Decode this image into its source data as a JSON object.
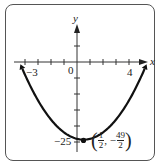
{
  "chart_data": {
    "type": "line",
    "title": "",
    "function": "y = x^2 - x - 24",
    "xlabel": "x",
    "ylabel": "y",
    "x_intercepts": [
      -3,
      4
    ],
    "y_intercept": -24,
    "vertex": {
      "x": 0.5,
      "y": -24.5,
      "label": "(1/2, -49/2)"
    },
    "tick_labels": {
      "x": [
        "-3",
        "0",
        "4"
      ],
      "y": [
        "-25"
      ]
    },
    "xlim": [
      -4.5,
      5.5
    ],
    "ylim": [
      -27,
      15
    ],
    "grid": false
  },
  "labels": {
    "x_axis": "x",
    "y_axis": "y",
    "origin": "0",
    "x_neg3": "−3",
    "x_4": "4",
    "y_neg25": "−25",
    "vertex_label_open": "(",
    "vertex_num1": "1",
    "vertex_den1": "2",
    "vertex_comma": ", −",
    "vertex_num2": "49",
    "vertex_den2": "2",
    "vertex_label_close": ")"
  },
  "colors": {
    "curve": "#111111",
    "axis": "#333333",
    "frame": "#555555"
  }
}
